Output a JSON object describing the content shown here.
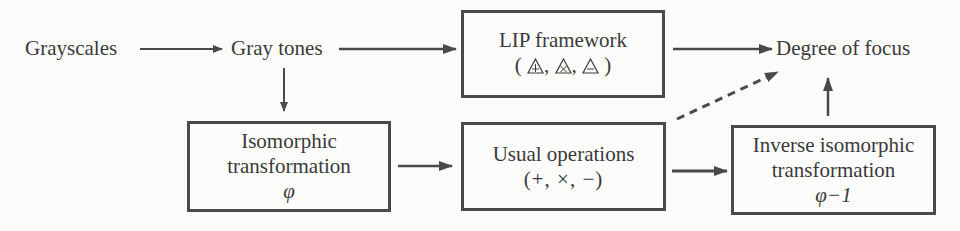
{
  "diagram": {
    "nodes": {
      "grayscales": {
        "label": "Grayscales"
      },
      "gray_tones": {
        "label": "Gray tones"
      },
      "lip_framework": {
        "title": "LIP framework",
        "symbols_open": "(",
        "symbols_close": ")",
        "symbol_separator": ",",
        "symbols": [
          "triangle-plus",
          "triangle-times",
          "triangle-minus"
        ]
      },
      "degree_of_focus": {
        "label": "Degree of focus"
      },
      "isomorphic": {
        "line1": "Isomorphic",
        "line2": "transformation",
        "symbol": "φ"
      },
      "usual_operations": {
        "line1": "Usual operations",
        "line2": "(+, ×, −)"
      },
      "inverse_isomorphic": {
        "line1": "Inverse isomorphic",
        "line2": "transformation",
        "symbol": "φ−1"
      }
    },
    "edges": [
      {
        "from": "grayscales",
        "to": "gray_tones",
        "style": "solid"
      },
      {
        "from": "gray_tones",
        "to": "lip_framework",
        "style": "solid"
      },
      {
        "from": "gray_tones",
        "to": "isomorphic",
        "style": "solid"
      },
      {
        "from": "lip_framework",
        "to": "degree_of_focus",
        "style": "solid"
      },
      {
        "from": "isomorphic",
        "to": "usual_operations",
        "style": "solid"
      },
      {
        "from": "usual_operations",
        "to": "inverse_isomorphic",
        "style": "solid"
      },
      {
        "from": "inverse_isomorphic",
        "to": "degree_of_focus",
        "style": "solid"
      },
      {
        "from": "usual_operations",
        "to": "degree_of_focus",
        "style": "dashed"
      }
    ],
    "colors": {
      "stroke": "#4a4a4a",
      "text": "#3a3a3a",
      "background": "#fbfbfa"
    }
  }
}
